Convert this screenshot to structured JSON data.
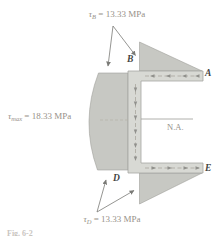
{
  "figure": {
    "type": "shear-stress-distribution-channel-section",
    "background": "#ffffff",
    "labels": {
      "tau_B": {
        "symbol": "τ",
        "subscript": "B",
        "value": "= 13.33 MPa"
      },
      "tau_max": {
        "symbol": "τ",
        "subscript": "max",
        "value": "= 18.33 MPa"
      },
      "tau_D": {
        "symbol": "τ",
        "subscript": "D",
        "value": "= 13.33 MPa"
      },
      "neutral_axis": "N.A.",
      "point_A": "A",
      "point_B": "B",
      "point_D": "D",
      "point_E": "E",
      "caption_partial": "Fig. 6-2"
    },
    "values": {
      "tau_B_MPa": 13.33,
      "tau_max_MPa": 18.33,
      "tau_D_MPa": 13.33
    },
    "colors": {
      "stress_fill": "#c7c8c3",
      "stress_stroke": "#a0a09b",
      "section_fill": "#d8d9d4",
      "section_stroke": "#a6a6a2",
      "centerline": "#a39f96",
      "flow_arrow": "#90908c",
      "leader_line": "#7a7a76",
      "na_line": "#9c9c98",
      "dash_dot_line": "#b5b1a6"
    }
  }
}
